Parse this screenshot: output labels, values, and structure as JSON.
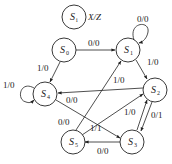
{
  "legend": {
    "state_symbol": "S",
    "state_subscript": "i",
    "io_label": "X/Z"
  },
  "states": [
    {
      "id": "S0",
      "symbol": "S",
      "sub": "0"
    },
    {
      "id": "S1",
      "symbol": "S",
      "sub": "1"
    },
    {
      "id": "S2",
      "symbol": "S",
      "sub": "2"
    },
    {
      "id": "S3",
      "symbol": "S",
      "sub": "3"
    },
    {
      "id": "S4",
      "symbol": "S",
      "sub": "4"
    },
    {
      "id": "S5",
      "symbol": "S",
      "sub": "5"
    }
  ],
  "transitions": [
    {
      "from": "S0",
      "to": "S1",
      "label": "0/0"
    },
    {
      "from": "S0",
      "to": "S4",
      "label": "1/0"
    },
    {
      "from": "S1",
      "to": "S1",
      "label": "0/0"
    },
    {
      "from": "S1",
      "to": "S2",
      "label": "1/0"
    },
    {
      "from": "S2",
      "to": "S4",
      "label": "1/0"
    },
    {
      "from": "S2",
      "to": "S3",
      "label": "0/1"
    },
    {
      "from": "S3",
      "to": "S2",
      "label": "1/0"
    },
    {
      "from": "S3",
      "to": "S5",
      "label": "0/0"
    },
    {
      "from": "S4",
      "to": "S4",
      "label": "1/0"
    },
    {
      "from": "S4",
      "to": "S3",
      "label": "0/0"
    },
    {
      "from": "S5",
      "to": "S1",
      "label": "0/0"
    },
    {
      "from": "S5",
      "to": "S2",
      "label": "1/1"
    }
  ]
}
